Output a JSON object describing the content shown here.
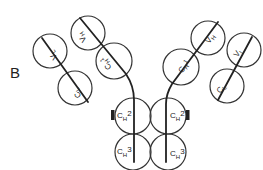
{
  "figure": {
    "panel_label": "B",
    "colors": {
      "stroke": "#333333",
      "background": "#ffffff"
    }
  },
  "domains": {
    "left_vh": "VH",
    "left_vl": "VL",
    "left_ch1": "CH1",
    "left_cl": "CL",
    "right_vh": "VH",
    "right_vl": "VL",
    "right_ch1": "CH1",
    "right_cl": "CL",
    "left_ch2": "CH2",
    "right_ch2": "CH2",
    "left_ch3": "CH3",
    "right_ch3": "CH3"
  },
  "labels": {
    "V": "V",
    "C": "C",
    "H": "H",
    "L": "L",
    "one": "1",
    "two": "2",
    "three": "3"
  }
}
